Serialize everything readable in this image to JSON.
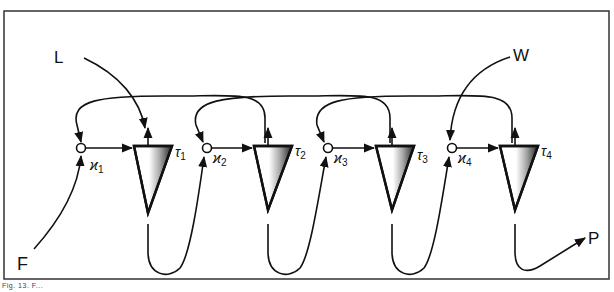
{
  "diagram": {
    "type": "block-flow",
    "caption": "Fig. 13. F...",
    "inputs": {
      "F": "F",
      "L": "L",
      "W": "W"
    },
    "output": "P",
    "stages": [
      {
        "junction_label": "ϰ",
        "junction_sub": "1",
        "block_label": "τ",
        "block_sub": "1"
      },
      {
        "junction_label": "ϰ",
        "junction_sub": "2",
        "block_label": "τ",
        "block_sub": "2"
      },
      {
        "junction_label": "ϰ",
        "junction_sub": "3",
        "block_label": "τ",
        "block_sub": "3"
      },
      {
        "junction_label": "ϰ",
        "junction_sub": "4",
        "block_label": "τ",
        "block_sub": "4"
      }
    ],
    "colors": {
      "line": "#111111",
      "background": "#ffffff",
      "frame": "#333333"
    }
  }
}
